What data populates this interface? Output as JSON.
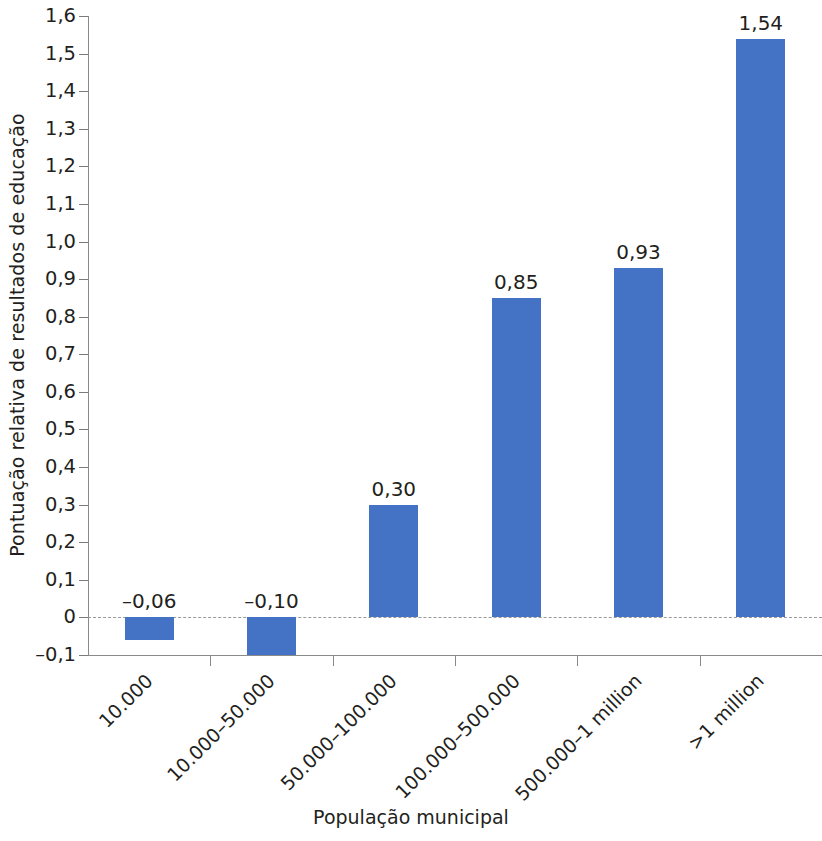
{
  "chart_data": {
    "type": "bar",
    "title": "",
    "subtitle": "",
    "xlabel": "População municipal",
    "ylabel": "Pontuação relativa de resultados de educação",
    "categories": [
      "10.000",
      "10.000–50.000",
      "50.000–100.000",
      "100.000–500.000",
      "500.000–1 million",
      ">1 million"
    ],
    "values": [
      -0.06,
      -0.1,
      0.3,
      0.85,
      0.93,
      1.54
    ],
    "value_labels": [
      "–0,06",
      "–0,10",
      "0,30",
      "0,85",
      "0,93",
      "1,54"
    ],
    "ylim": [
      -0.1,
      1.6
    ],
    "ytick_values": [
      1.6,
      1.5,
      1.4,
      1.3,
      1.2,
      1.1,
      1.0,
      0.9,
      0.8,
      0.7,
      0.6,
      0.5,
      0.4,
      0.3,
      0.2,
      0.1,
      0.0,
      -0.1
    ],
    "ytick_labels": [
      "1,6",
      "1,5",
      "1,4",
      "1,3",
      "1,2",
      "1,1",
      "1,0",
      "0,9",
      "0,8",
      "0,7",
      "0,6",
      "0,5",
      "0,4",
      "0,3",
      "0,2",
      "0,1",
      "0",
      "–0,1"
    ],
    "decimal_separator": ",",
    "grid": false,
    "zero_line": true,
    "zero_line_style": "dashed",
    "legend": null,
    "legend_position": "none",
    "bar_color": "#4472c4",
    "axis_color": "#8a8a8a",
    "zero_line_color": "#9a9a9a",
    "text_color": "#231f20",
    "background_color": "#ffffff"
  }
}
